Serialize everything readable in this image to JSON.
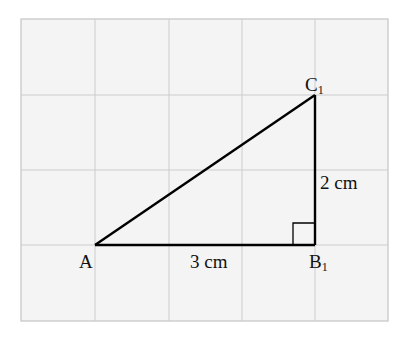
{
  "diagram": {
    "type": "right-triangle-on-grid",
    "grid": {
      "columns": 5,
      "rows": 4,
      "cell_unit": "1 cm",
      "background": "#f4f4f4",
      "line_color": "#c8c8c8"
    },
    "vertices": {
      "A": {
        "label": "A",
        "grid": [
          1,
          3
        ]
      },
      "B": {
        "label": "B",
        "subscript": "1",
        "grid": [
          4,
          3
        ]
      },
      "C": {
        "label": "C",
        "subscript": "1",
        "grid": [
          4,
          1
        ]
      }
    },
    "edges": {
      "AB": {
        "label": "3 cm"
      },
      "BC": {
        "label": "2 cm"
      },
      "AC": {
        "label": ""
      }
    },
    "right_angle_at": "B1",
    "line_color": "#000000"
  }
}
